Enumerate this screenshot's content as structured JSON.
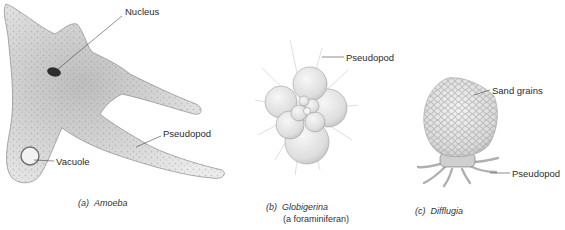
{
  "figure": {
    "panels": [
      {
        "id": "a",
        "letter": "(a)",
        "name": "Amoeba",
        "subtitle": "",
        "labels": {
          "nucleus": "Nucleus",
          "pseudopod": "Pseudopod",
          "vacuole": "Vacuole"
        }
      },
      {
        "id": "b",
        "letter": "(b)",
        "name": "Globigerina",
        "subtitle": "(a foraminiferan)",
        "labels": {
          "pseudopod": "Pseudopod"
        }
      },
      {
        "id": "c",
        "letter": "(c)",
        "name": "Difflugia",
        "subtitle": "",
        "labels": {
          "sand_grains": "Sand grains",
          "pseudopod": "Pseudopod"
        }
      }
    ],
    "colors": {
      "background": "#ffffff",
      "ink": "#2b2b2b",
      "cell_fill": "#d9d9d9",
      "cell_shade": "#a8a8a8",
      "nucleus": "#2e2e2e",
      "shell": "#e6e6e6"
    }
  }
}
